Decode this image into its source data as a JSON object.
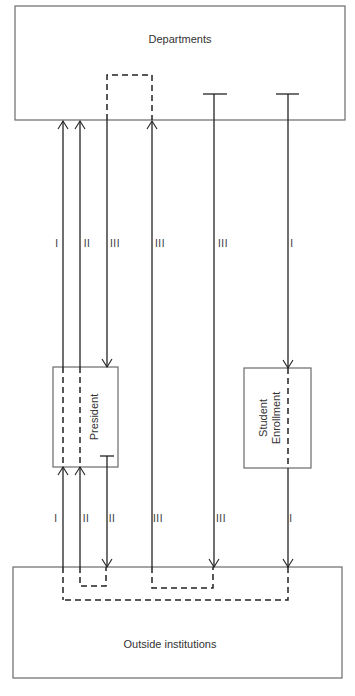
{
  "diagram": {
    "nodes": {
      "departments": {
        "label": "Departments"
      },
      "president": {
        "label": "President"
      },
      "student_enrollment": {
        "label_line1": "Student",
        "label_line2": "Enrollment"
      },
      "outside_institutions": {
        "label": "Outside institutions"
      }
    },
    "upper_labels": [
      "I",
      "II",
      "III",
      "III",
      "III",
      "I"
    ],
    "lower_labels": [
      "I",
      "II",
      "II",
      "III",
      "III",
      "I"
    ],
    "colors": {
      "line": "#222222",
      "box_border": "#6a6a6a",
      "background": "#ffffff"
    }
  }
}
